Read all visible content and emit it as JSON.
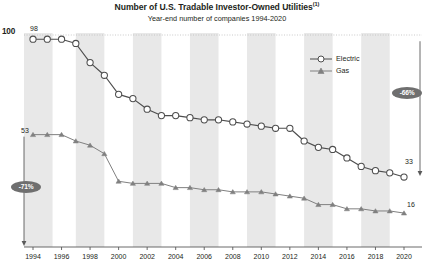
{
  "header": {
    "title": "Number of U.S. Tradable Investor-Owned Utilities",
    "title_footnote": "(1)",
    "subtitle": "Year-end number of companies 1994-2020"
  },
  "axis": {
    "y_max_label": "100",
    "x_tick_labels": [
      "1994",
      "1996",
      "1998",
      "2000",
      "2002",
      "2004",
      "2006",
      "2008",
      "2010",
      "2012",
      "2014",
      "2016",
      "2018",
      "2020"
    ]
  },
  "annotations": {
    "electric_start_value": "98",
    "electric_end_value": "33",
    "gas_start_value": "53",
    "gas_end_value": "16",
    "electric_change_badge": "-66%",
    "gas_change_badge": "-71%"
  },
  "legend": {
    "position": "inside-top-right",
    "items": [
      {
        "label": "Electric",
        "marker": "open-circle",
        "color": "#4d4d4d"
      },
      {
        "label": "Gas",
        "marker": "filled-triangle",
        "color": "#808080"
      }
    ]
  },
  "colors": {
    "electric_line": "#4d4d4d",
    "gas_line": "#808080",
    "band": "#e8e8e8",
    "text": "#231f20",
    "badge_bg": "#6f6f6f",
    "gridline": "#bdbdbd"
  },
  "chart_data": {
    "type": "line",
    "subtitle": "Year-end number of companies 1994-2020",
    "xlabel": "",
    "ylabel": "",
    "ylim": [
      0,
      100
    ],
    "grid": false,
    "vertical_bands": true,
    "x": [
      1994,
      1995,
      1996,
      1997,
      1998,
      1999,
      2000,
      2001,
      2002,
      2003,
      2004,
      2005,
      2006,
      2007,
      2008,
      2009,
      2010,
      2011,
      2012,
      2013,
      2014,
      2015,
      2016,
      2017,
      2018,
      2019,
      2020
    ],
    "series": [
      {
        "name": "Electric",
        "marker": "open-circle",
        "values": [
          98,
          98,
          98,
          96,
          87,
          81,
          72,
          70,
          65,
          62,
          62,
          61,
          60,
          60,
          59,
          58,
          57,
          56,
          56,
          50,
          47,
          46,
          42,
          38,
          36,
          35,
          33
        ]
      },
      {
        "name": "Gas",
        "marker": "filled-triangle",
        "values": [
          53,
          53,
          53,
          50,
          48,
          44,
          31,
          30,
          30,
          30,
          28,
          28,
          27,
          27,
          26,
          26,
          26,
          25,
          24,
          23,
          20,
          20,
          18,
          18,
          17,
          17,
          16
        ]
      }
    ],
    "annotations": [
      {
        "text": "98",
        "series": "Electric",
        "x": 1994,
        "y": 98
      },
      {
        "text": "33",
        "series": "Electric",
        "x": 2020,
        "y": 33
      },
      {
        "text": "53",
        "series": "Gas",
        "x": 1994,
        "y": 53
      },
      {
        "text": "16",
        "series": "Gas",
        "x": 2020,
        "y": 16
      },
      {
        "text": "-66%",
        "type": "change-badge",
        "series": "Electric"
      },
      {
        "text": "-71%",
        "type": "change-badge",
        "series": "Gas"
      }
    ]
  }
}
